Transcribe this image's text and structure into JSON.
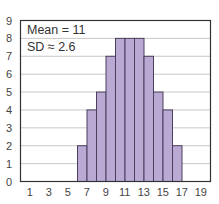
{
  "chart_data": {
    "type": "bar",
    "title": "",
    "xlabel": "",
    "ylabel": "",
    "bin_edges": [
      6,
      7,
      8,
      9,
      10,
      11,
      12,
      13,
      14,
      15,
      16,
      17
    ],
    "categories": [
      "6-7",
      "7-8",
      "8-9",
      "9-10",
      "10-11",
      "11-12",
      "12-13",
      "13-14",
      "14-15",
      "15-16",
      "16-17"
    ],
    "values": [
      2,
      4,
      5,
      7,
      8,
      8,
      8,
      7,
      5,
      4,
      2
    ],
    "xlim": [
      0,
      20
    ],
    "ylim": [
      0,
      9
    ],
    "x_ticks": [
      "1",
      "3",
      "5",
      "7",
      "9",
      "11",
      "13",
      "15",
      "17",
      "19"
    ],
    "y_ticks": [
      "0",
      "1",
      "2",
      "3",
      "4",
      "5",
      "6",
      "7",
      "8",
      "9"
    ],
    "grid": true,
    "annotations": [
      "Mean = 11",
      "SD ≈ 2.6"
    ],
    "colors": {
      "bar_fill": "#b9a9d3",
      "bar_edge": "#4a3f5c",
      "grid": "#c8c8c8",
      "axis": "#333333"
    }
  }
}
